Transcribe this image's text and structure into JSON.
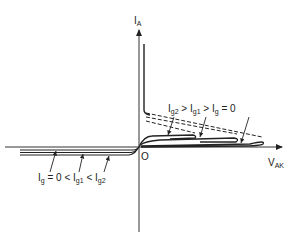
{
  "diagram": {
    "y_axis_label": "I",
    "y_axis_sub": "A",
    "x_axis_label": "V",
    "x_axis_sub": "AK",
    "origin_label": "O",
    "forward_annotation": {
      "parts": [
        {
          "main": "I",
          "sub": "g2"
        },
        {
          "op": " > "
        },
        {
          "main": "I",
          "sub": "g1"
        },
        {
          "op": " > "
        },
        {
          "main": "I",
          "sub": "g"
        },
        {
          "op": " = 0"
        }
      ]
    },
    "reverse_annotation": {
      "parts": [
        {
          "main": "I",
          "sub": "g"
        },
        {
          "op": " = 0 < "
        },
        {
          "main": "I",
          "sub": "g1"
        },
        {
          "op": " < "
        },
        {
          "main": "I",
          "sub": "g2"
        }
      ]
    },
    "colors": {
      "line": "#222222",
      "background": "#ffffff"
    }
  }
}
